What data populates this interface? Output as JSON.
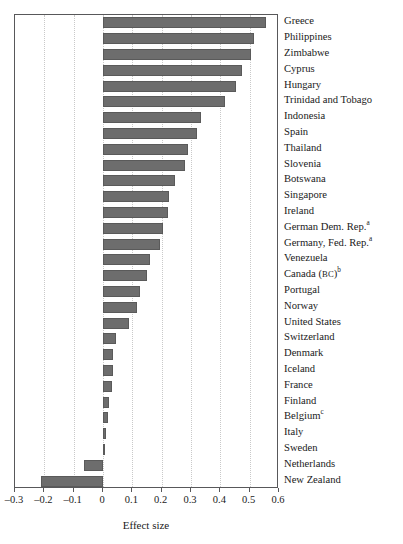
{
  "chart_data": {
    "type": "bar",
    "orientation": "horizontal",
    "title": "",
    "xlabel": "Effect size",
    "ylabel": "",
    "xlim": [
      -0.3,
      0.6
    ],
    "xticks": [
      -0.3,
      -0.2,
      -0.1,
      0,
      0.1,
      0.2,
      0.3,
      0.4,
      0.5,
      0.6
    ],
    "xticklabels": [
      "–0.3",
      "–0.2",
      "–0.1",
      "0",
      "0.1",
      "0.2",
      "0.3",
      "0.4",
      "0.5",
      "0.6"
    ],
    "grid": "vertical-dotted",
    "legend": "none",
    "bar_color": "#6d6d6d",
    "categories": [
      "Greece",
      "Philippines",
      "Zimbabwe",
      "Cyprus",
      "Hungary",
      "Trinidad and Tobago",
      "Indonesia",
      "Spain",
      "Thailand",
      "Slovenia",
      "Botswana",
      "Singapore",
      "Ireland",
      "German Dem. Rep.",
      "Germany, Fed. Rep.",
      "Venezuela",
      "Canada (BC)",
      "Portugal",
      "Norway",
      "United States",
      "Switzerland",
      "Denmark",
      "Iceland",
      "France",
      "Finland",
      "Belgium",
      "Italy",
      "Sweden",
      "Netherlands",
      "New Zealand"
    ],
    "category_footnotes": [
      "",
      "",
      "",
      "",
      "",
      "",
      "",
      "",
      "",
      "",
      "",
      "",
      "",
      "a",
      "a",
      "",
      "b",
      "",
      "",
      "",
      "",
      "",
      "",
      "",
      "",
      "c",
      "",
      "",
      "",
      ""
    ],
    "values": [
      0.555,
      0.515,
      0.505,
      0.475,
      0.455,
      0.415,
      0.335,
      0.32,
      0.29,
      0.28,
      0.245,
      0.225,
      0.22,
      0.205,
      0.195,
      0.16,
      0.15,
      0.125,
      0.115,
      0.09,
      0.045,
      0.035,
      0.035,
      0.03,
      0.02,
      0.018,
      0.01,
      0.005,
      -0.065,
      -0.212
    ]
  },
  "axis": {
    "xaxis_title": "Effect size"
  }
}
